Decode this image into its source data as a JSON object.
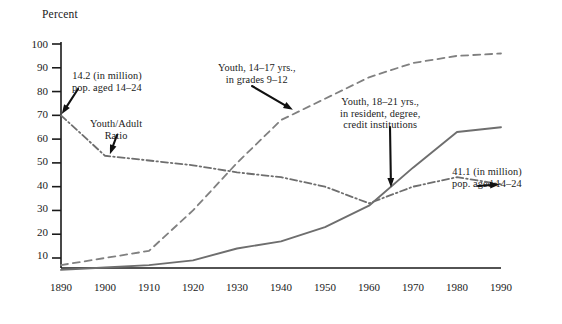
{
  "chart_data": {
    "type": "line",
    "title": "",
    "xlabel": "",
    "ylabel": "Percent",
    "xlim": [
      1890,
      1990
    ],
    "ylim": [
      0,
      103
    ],
    "grid": false,
    "legend_position": "inline-annotations",
    "x_ticks": [
      "1890",
      "1900",
      "1910",
      "1920",
      "1930",
      "1940",
      "1950",
      "1960",
      "1970",
      "1980",
      "1990"
    ],
    "y_ticks": [
      "10",
      "20",
      "30",
      "40",
      "50",
      "60",
      "70",
      "80",
      "90",
      "100"
    ],
    "series": [
      {
        "name": "Youth/Adult Ratio",
        "style": "dash-dot",
        "color": "#6e6e6e",
        "x": [
          1890,
          1900,
          1910,
          1920,
          1930,
          1940,
          1950,
          1960,
          1970,
          1980,
          1990
        ],
        "values": [
          70,
          53,
          51,
          49,
          46,
          44,
          40,
          33,
          40,
          44,
          41
        ]
      },
      {
        "name": "Youth, 14-17 yrs., in grades 9-12",
        "style": "dashed",
        "color": "#808080",
        "x": [
          1890,
          1900,
          1910,
          1920,
          1930,
          1940,
          1950,
          1960,
          1970,
          1980,
          1990
        ],
        "values": [
          7,
          10,
          13,
          30,
          50,
          68,
          77,
          86,
          92,
          95,
          96
        ]
      },
      {
        "name": "Youth, 18-21 yrs., in resident, degree, credit institutions",
        "style": "solid",
        "color": "#6e6e6e",
        "x": [
          1890,
          1900,
          1910,
          1920,
          1930,
          1940,
          1950,
          1960,
          1970,
          1980,
          1990
        ],
        "values": [
          5,
          6,
          7,
          9,
          14,
          17,
          23,
          32,
          48,
          63,
          65
        ]
      }
    ],
    "annotations": [
      {
        "name": "pop-1890-annotation",
        "lines": [
          "14.2 (in million)",
          "pop. aged 14–24"
        ],
        "points_to": {
          "x": 1890,
          "y": 70
        }
      },
      {
        "name": "youth-adult-ratio-annotation",
        "lines": [
          "Youth/Adult",
          "Ratio"
        ],
        "points_to": {
          "x": 1901,
          "y": 53
        }
      },
      {
        "name": "grades-9-12-annotation",
        "lines": [
          "Youth, 14–17 yrs.,",
          "in grades 9–12"
        ],
        "points_to": {
          "x": 1943,
          "y": 72
        }
      },
      {
        "name": "higher-education-annotation",
        "lines": [
          "Youth, 18–21 yrs.,",
          "in resident, degree,",
          "credit institutions"
        ],
        "points_to": {
          "x": 1965,
          "y": 39
        }
      },
      {
        "name": "pop-1990-annotation",
        "lines": [
          "41.1 (in million)",
          "pop. aged 14–24"
        ],
        "points_to": {
          "x": 1990,
          "y": 41
        }
      }
    ]
  }
}
